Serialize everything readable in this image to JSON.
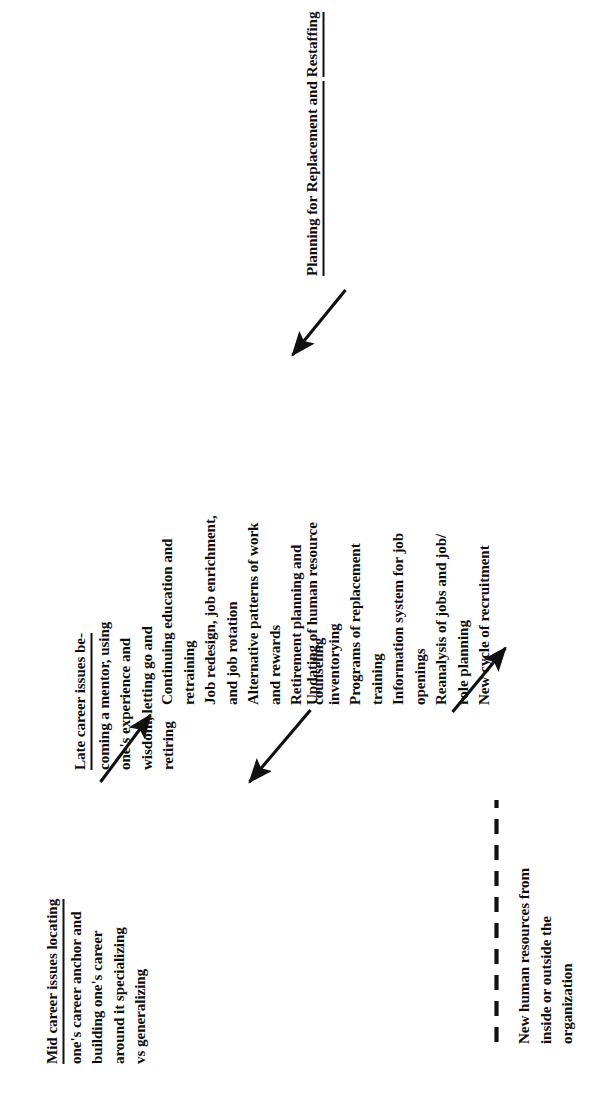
{
  "diagram": {
    "type": "flow-diagram",
    "orientation": "rotated-90-ccw",
    "title_blocks": [
      {
        "id": "mid-career",
        "lines": [
          "Mid career issues locating",
          "one's career anchor and",
          "building one's career",
          "around it specializing",
          "vs generalizing"
        ],
        "underlined_lines": 1
      },
      {
        "id": "late-career",
        "lines": [
          "Late career issues be-",
          "coming a mentor, using",
          "one's experience and",
          "wisdom, letting go and",
          "retiring"
        ],
        "underlined_lines": 1
      },
      {
        "id": "new-human-resources",
        "lines": [
          "New human resources from",
          "inside or outside the",
          "organization"
        ],
        "underlined_lines": 0
      },
      {
        "id": "planning-replacement",
        "lines": [
          "Planning for Replacement and",
          "Restaffing"
        ],
        "underlined_lines": 2
      }
    ],
    "lists": [
      {
        "id": "career-development-activities",
        "items": [
          "Continuing education and",
          "retraining",
          "Job redesign, job enrichment,",
          "and job rotation",
          "Alternative patterns of work",
          "and rewards",
          "Retirement planning and",
          "counseling"
        ]
      },
      {
        "id": "replacement-staffing-activities",
        "items": [
          "Updating of human resource",
          "inventorying",
          "Programs of replacement",
          "training",
          "Information system for job",
          "openings",
          "Reanalysis of jobs and job/",
          "role planning",
          "New cycle of recruitment"
        ]
      }
    ],
    "connectors": [
      {
        "id": "mid-career-to-activities",
        "style": "solid-arrow"
      },
      {
        "id": "activities-to-late-career",
        "style": "solid-arrow"
      },
      {
        "id": "planning-to-staffing-activities",
        "style": "solid-arrow"
      },
      {
        "id": "staffing-to-new-human-resources",
        "style": "solid-arrow"
      },
      {
        "id": "new-human-resources-bracket",
        "style": "dashed-line"
      }
    ],
    "colors": {
      "ink": "#111111",
      "background": "#ffffff"
    }
  }
}
